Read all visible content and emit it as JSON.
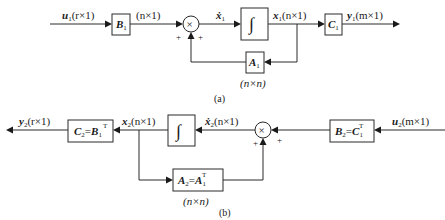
{
  "diagram_a": {
    "caption": "(a)",
    "input": {
      "symbol": "u",
      "sub": "1",
      "dim": "(r×1)"
    },
    "b_block": {
      "symbol": "B",
      "sub": "1"
    },
    "b_out_dim": "(n×1)",
    "sum": {
      "glyph": "×",
      "sign_left": "+",
      "sign_bottom": "+"
    },
    "xdot": {
      "symbol": "ẋ",
      "sub": "1"
    },
    "integrator": {
      "glyph": "∫"
    },
    "state": {
      "symbol": "x",
      "sub": "1",
      "dim": "(n×1)"
    },
    "a_block": {
      "symbol": "A",
      "sub": "1",
      "dim": "(n×n)"
    },
    "c_block": {
      "symbol": "C",
      "sub": "1"
    },
    "output": {
      "symbol": "y",
      "sub": "1",
      "dim": "(m×1)"
    }
  },
  "diagram_b": {
    "caption": "(b)",
    "output": {
      "symbol": "y",
      "sub": "2",
      "dim": "(r×1)"
    },
    "c_block": {
      "lhs": "C",
      "lhs_sub": "2",
      "eq": "=",
      "rhs": "B",
      "rhs_sub": "1",
      "sup": "T"
    },
    "state": {
      "symbol": "x",
      "sub": "2",
      "dim": "(n×1)"
    },
    "integrator": {
      "glyph": "∫"
    },
    "xdot": {
      "symbol": "ẋ",
      "sub": "2",
      "dim": "(n×1)"
    },
    "sum": {
      "glyph": "×",
      "sign_right": "+",
      "sign_bottom": "+"
    },
    "b_block": {
      "lhs": "B",
      "lhs_sub": "2",
      "eq": "=",
      "rhs": "C",
      "rhs_sub": "1",
      "sup": "T"
    },
    "input": {
      "symbol": "u",
      "sub": "2",
      "dim": "(m×1)"
    },
    "a_block": {
      "lhs": "A",
      "lhs_sub": "2",
      "eq": "=",
      "rhs": "A",
      "rhs_sub": "1",
      "sup": "T",
      "dim": "(n×n)"
    }
  }
}
